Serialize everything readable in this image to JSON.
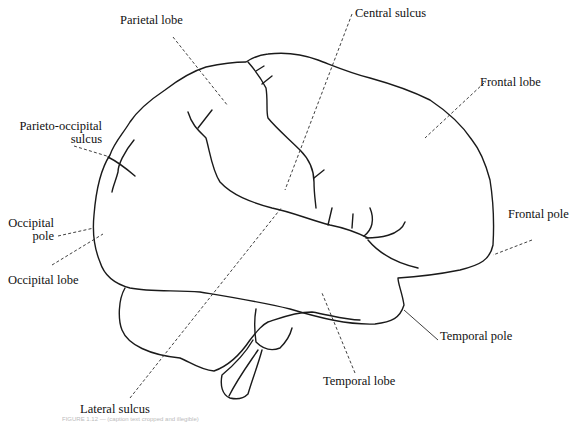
{
  "figure": {
    "caption_visible": "FIGURE 1.12 — (caption text cropped and illegible)"
  },
  "labels": {
    "parietal_lobe": "Parietal lobe",
    "central_sulcus": "Central sulcus",
    "frontal_lobe": "Frontal lobe",
    "parieto_occipital_1": "Parieto-occipital",
    "parieto_occipital_2": "sulcus",
    "occipital_pole_1": "Occipital",
    "occipital_pole_2": "pole",
    "occipital_lobe": "Occipital lobe",
    "frontal_pole": "Frontal pole",
    "temporal_pole": "Temporal pole",
    "temporal_lobe": "Temporal lobe",
    "lateral_sulcus": "Lateral sulcus"
  },
  "colors": {
    "ink": "#1a1a1a",
    "background": "#ffffff"
  }
}
